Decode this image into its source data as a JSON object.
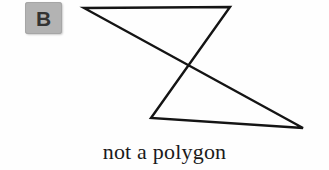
{
  "figure": {
    "label": "B",
    "caption": "not a polygon",
    "background_color": "#fefefe",
    "badge": {
      "icon": "letter-badge",
      "fill_color": "#b3b3b3",
      "text_color": "#333333"
    },
    "shape": {
      "name": "self-intersecting-quadrilateral",
      "stroke_color": "#141414",
      "stroke_width": 2.4,
      "closed": true,
      "vertices": [
        {
          "name": "top-left",
          "x": 84,
          "y": 8
        },
        {
          "name": "top-right",
          "x": 230,
          "y": 7
        },
        {
          "name": "bottom-left",
          "x": 151,
          "y": 118
        },
        {
          "name": "bottom-right",
          "x": 303,
          "y": 128
        }
      ],
      "edges": [
        {
          "from": "top-left",
          "to": "top-right"
        },
        {
          "from": "top-right",
          "to": "bottom-left"
        },
        {
          "from": "bottom-left",
          "to": "bottom-right"
        },
        {
          "from": "bottom-right",
          "to": "top-left"
        }
      ],
      "intersection": {
        "name": "crossing-point",
        "x": 184,
        "y": 66
      },
      "path": "M 84 8 L 230 7 L 151 118 L 303 128 Z"
    }
  }
}
